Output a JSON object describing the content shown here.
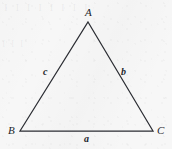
{
  "figure": {
    "kind": "geometry-diagram",
    "shape": "triangle",
    "stroke_color": "#2b2d33",
    "label_color": "#24262b",
    "background_color": "#f7f7f7",
    "ghost_bleed_top": "I I I I I I I I",
    "ghost_bleed_left": "I I I"
  },
  "geometry": {
    "canvas": {
      "width": 172,
      "height": 149
    },
    "vertices": [
      {
        "id": "A",
        "label": "A",
        "x": 88,
        "y": 22,
        "label_x": 85,
        "label_y": 7
      },
      {
        "id": "B",
        "label": "B",
        "x": 20,
        "y": 131,
        "label_x": 8,
        "label_y": 125
      },
      {
        "id": "C",
        "label": "C",
        "x": 153,
        "y": 131,
        "label_x": 157,
        "label_y": 125
      }
    ],
    "sides": [
      {
        "id": "a",
        "label": "a",
        "between": "B-C",
        "label_x": 84,
        "label_y": 134
      },
      {
        "id": "b",
        "label": "b",
        "between": "A-C",
        "label_x": 121,
        "label_y": 67
      },
      {
        "id": "c",
        "label": "c",
        "between": "A-B",
        "label_x": 43,
        "label_y": 67
      }
    ],
    "polygon_points": "88,22 153,131 20,131"
  }
}
